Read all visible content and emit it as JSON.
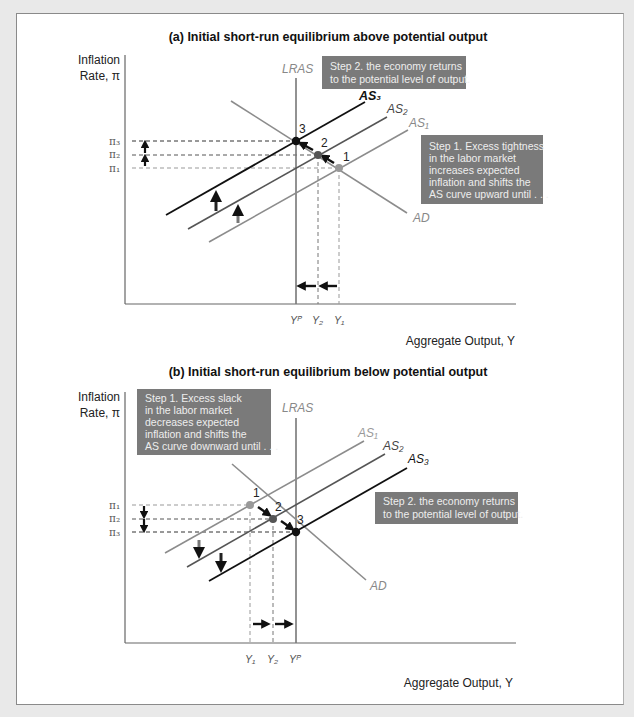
{
  "figure": {
    "panel_a": {
      "title": "(a) Initial short-run equilibrium above potential output",
      "y_axis_label_line1": "Inflation",
      "y_axis_label_line2": "Rate, π",
      "x_axis_label": "Aggregate Output, Y",
      "curves": {
        "lras": "LRAS",
        "as1": "AS₁",
        "as2": "AS₂",
        "as3": "AS₃",
        "ad": "AD"
      },
      "y_ticks": [
        "π₃",
        "π₂",
        "π₁"
      ],
      "x_ticks": [
        "Yᴾ",
        "Y₂",
        "Y₁"
      ],
      "points": [
        "1",
        "2",
        "3"
      ],
      "step1_lines": [
        "Step 1. Excess tightness",
        "in the labor market",
        "increases expected",
        "inflation and shifts the",
        "AS curve upward until . . ."
      ],
      "step2_lines": [
        "Step 2. the economy returns",
        "to the potential level of output."
      ]
    },
    "panel_b": {
      "title": "(b) Initial short-run equilibrium below potential output",
      "y_axis_label_line1": "Inflation",
      "y_axis_label_line2": "Rate, π",
      "x_axis_label": "Aggregate Output, Y",
      "curves": {
        "lras": "LRAS",
        "as1": "AS₁",
        "as2": "AS₂",
        "as3": "AS₃",
        "ad": "AD"
      },
      "y_ticks": [
        "π₁",
        "π₂",
        "π₃"
      ],
      "x_ticks": [
        "Y₁",
        "Y₂",
        "Yᴾ"
      ],
      "points": [
        "1",
        "2",
        "3"
      ],
      "step1_lines": [
        "Step 1. Excess slack",
        "in the labor market",
        "decreases expected",
        "inflation and shifts the",
        "AS curve downward until . . ."
      ],
      "step2_lines": [
        "Step 2. the economy returns",
        "to the potential level of output."
      ]
    },
    "colors": {
      "as1": "#8c8c8c",
      "as2": "#555555",
      "as3": "#111111",
      "lras": "#777777",
      "ad": "#8c8c8c",
      "note_box": "#7a7a7a",
      "arrow": "#111111"
    }
  }
}
